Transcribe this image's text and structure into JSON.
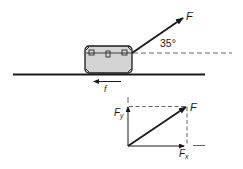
{
  "top_diagram": {
    "force_label": "F",
    "angle_label": "35°",
    "friction_label": "f"
  },
  "components_diagram": {
    "resultant_label": "F",
    "y_component_label": "F",
    "y_component_sub": "y",
    "x_component_label": "F",
    "x_component_sub": "x"
  },
  "colors": {
    "ink": "#1a1a1a",
    "box_fill": "#d4d4d4",
    "dash": "#555555"
  }
}
